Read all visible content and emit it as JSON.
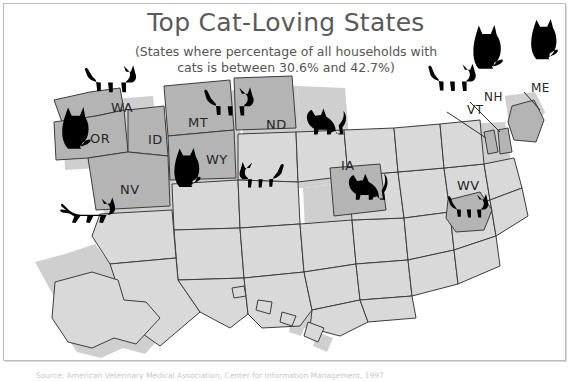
{
  "title": "Top Cat-Loving States",
  "subtitle_line1": "(States where percentage of all households with",
  "subtitle_line2": "cats is between 30.6% and 42.7%)",
  "source": "Source: American Veterinary Medical Association, Center for Information Management, 1997",
  "colors": {
    "highlight_fill": "#b4b4b4",
    "base_fill": "#d9d9d9",
    "outline": "#3c3c3c",
    "cat": "#000000",
    "title_text": "#5a5a5a",
    "label_text": "#262626",
    "frame": "#bdbdbd",
    "shadow": "#cfcfcf"
  },
  "state_labels": [
    {
      "abbr": "WA",
      "x": 111,
      "y": 100
    },
    {
      "abbr": "OR",
      "x": 90,
      "y": 131
    },
    {
      "abbr": "ID",
      "x": 148,
      "y": 132
    },
    {
      "abbr": "MT",
      "x": 188,
      "y": 115
    },
    {
      "abbr": "ND",
      "x": 266,
      "y": 117
    },
    {
      "abbr": "WY",
      "x": 206,
      "y": 152
    },
    {
      "abbr": "NV",
      "x": 120,
      "y": 182
    },
    {
      "abbr": "IA",
      "x": 341,
      "y": 158
    },
    {
      "abbr": "WV",
      "x": 457,
      "y": 178
    },
    {
      "abbr": "VT",
      "x": 467,
      "y": 103
    },
    {
      "abbr": "NH",
      "x": 484,
      "y": 90
    },
    {
      "abbr": "ME",
      "x": 531,
      "y": 81
    }
  ],
  "highlighted_states": [
    "WA",
    "OR",
    "ID",
    "MT",
    "WY",
    "NV",
    "ND",
    "IA",
    "VT",
    "NH",
    "ME",
    "WV"
  ],
  "cats": [
    {
      "name": "cat-washington-sitting",
      "pose": "sitting",
      "x": 56,
      "y": 104,
      "w": 36,
      "h": 46,
      "flip": false
    },
    {
      "name": "cat-washington-walking",
      "pose": "walking",
      "x": 84,
      "y": 62,
      "w": 54,
      "h": 34,
      "flip": false
    },
    {
      "name": "cat-montana-walking",
      "pose": "walking",
      "x": 204,
      "y": 85,
      "w": 52,
      "h": 34,
      "flip": false
    },
    {
      "name": "cat-dakota-standing",
      "pose": "standing",
      "x": 301,
      "y": 105,
      "w": 46,
      "h": 32,
      "flip": false
    },
    {
      "name": "cat-idaho-sitting",
      "pose": "sitting",
      "x": 170,
      "y": 145,
      "w": 32,
      "h": 42,
      "flip": false
    },
    {
      "name": "cat-wyoming-walking",
      "pose": "walking",
      "x": 238,
      "y": 160,
      "w": 46,
      "h": 30,
      "flip": true
    },
    {
      "name": "cat-california-running",
      "pose": "running",
      "x": 60,
      "y": 196,
      "w": 56,
      "h": 28,
      "flip": false
    },
    {
      "name": "cat-iowa-standing",
      "pose": "standing",
      "x": 345,
      "y": 168,
      "w": 44,
      "h": 34,
      "flip": false
    },
    {
      "name": "cat-westvirginia-walking",
      "pose": "walking",
      "x": 447,
      "y": 192,
      "w": 42,
      "h": 28,
      "flip": false
    },
    {
      "name": "cat-vermont-walking",
      "pose": "walking",
      "x": 428,
      "y": 62,
      "w": 50,
      "h": 32,
      "flip": false
    },
    {
      "name": "cat-newengland-sitting",
      "pose": "sitting",
      "x": 468,
      "y": 22,
      "w": 36,
      "h": 48,
      "flip": false
    },
    {
      "name": "cat-maine-sitting",
      "pose": "sitting",
      "x": 527,
      "y": 16,
      "w": 32,
      "h": 44,
      "flip": false
    }
  ]
}
